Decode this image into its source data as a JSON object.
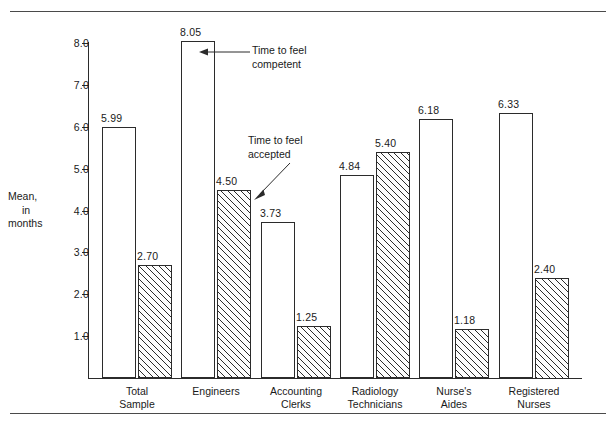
{
  "chart_data": {
    "type": "bar",
    "title": "",
    "xlabel": "",
    "ylabel": "Mean, in months",
    "ylabel_lines": [
      "Mean,",
      "in",
      "months"
    ],
    "ylim": [
      0,
      8.5
    ],
    "ytick_labels": [
      "1.0",
      "2.0",
      "3.0",
      "4.0",
      "5.0",
      "6.0",
      "7.0",
      "8.0"
    ],
    "ytick_values": [
      1.0,
      2.0,
      3.0,
      4.0,
      5.0,
      6.0,
      7.0,
      8.0
    ],
    "grid": false,
    "legend_position": "annotations",
    "categories": [
      "Total Sample",
      "Engineers",
      "Accounting Clerks",
      "Radiology Technicians",
      "Nurse's Aides",
      "Registered Nurses"
    ],
    "category_lines": [
      [
        "Total",
        "Sample"
      ],
      [
        "Engineers",
        ""
      ],
      [
        "Accounting",
        "Clerks"
      ],
      [
        "Radiology",
        "Technicians"
      ],
      [
        "Nurse's",
        "Aides"
      ],
      [
        "Registered",
        "Nurses"
      ]
    ],
    "series": [
      {
        "name": "Time to feel competent",
        "style": "open",
        "values": [
          5.99,
          8.05,
          3.73,
          4.84,
          6.18,
          6.33
        ],
        "labels": [
          "5.99",
          "8.05",
          "3.73",
          "4.84",
          "6.18",
          "6.33"
        ]
      },
      {
        "name": "Time to feel accepted",
        "style": "hatched",
        "values": [
          2.7,
          4.5,
          1.25,
          5.4,
          1.18,
          2.4
        ],
        "labels": [
          "2.70",
          "4.50",
          "1.25",
          "5.40",
          "1.18",
          "2.40"
        ]
      }
    ],
    "annotations": [
      {
        "id": "annotation-competent",
        "lines": [
          "Time to feel",
          "competent"
        ],
        "arrow": "left"
      },
      {
        "id": "annotation-accepted",
        "lines": [
          "Time to feel",
          "accepted"
        ],
        "arrow": "down-left"
      }
    ]
  },
  "colors": {
    "line": "#2b2b2b",
    "rule": "#4a4a4a",
    "background": "#ffffff",
    "bar_open_fill": "#ffffff",
    "bar_hatch_fill": "#fdfdfd"
  }
}
